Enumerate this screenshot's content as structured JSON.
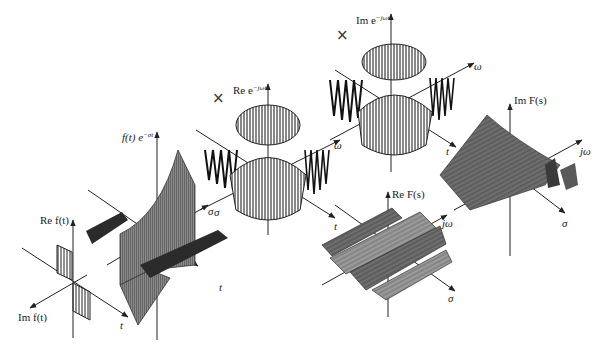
{
  "figure": {
    "panels": [
      {
        "id": "signal",
        "vertical_axis": "Re f(t)",
        "depth_axis": "Im f(t)",
        "horizontal_axis": "t"
      },
      {
        "id": "damped-signal",
        "vertical_axis": "f(t) e^{-σt}",
        "vertical_axis_main": "f(t) e",
        "vertical_axis_exp": "−σt",
        "axis_sigma": "σ",
        "axis_t": "t"
      },
      {
        "id": "real-kernel",
        "operator": "×",
        "vertical_axis_main": "Re e",
        "vertical_axis_exp": "−jωt",
        "axis_omega": "ω",
        "axis_sigma": "σ",
        "axis_t": "t"
      },
      {
        "id": "imag-kernel",
        "operator": "×",
        "vertical_axis_main": "Im e",
        "vertical_axis_exp": "−jωt",
        "axis_omega": "ω",
        "axis_t": "t"
      },
      {
        "id": "real-transform",
        "vertical_axis": "Re F(s)",
        "axis_jomega": "jω",
        "axis_sigma": "σ"
      },
      {
        "id": "imag-transform",
        "vertical_axis": "Im F(s)",
        "axis_jomega": "jω",
        "axis_sigma": "σ"
      }
    ],
    "colors": {
      "ink": "#222222",
      "surface_dark": "#3a3a3a",
      "surface_mid": "#7a7a7a",
      "surface_light": "#b5b5b5"
    }
  }
}
